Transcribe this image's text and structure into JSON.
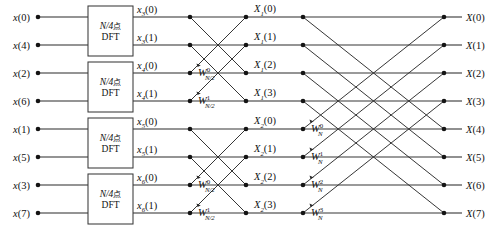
{
  "diagram": {
    "type": "fft-butterfly",
    "colors": {
      "background": "#ffffff",
      "line": "#2b2b2b",
      "node": "#141414",
      "text": "#111111",
      "box_stroke": "#3a3a3a"
    },
    "geometry": {
      "width": 498,
      "height": 236,
      "row_y": [
        17,
        45,
        73,
        101,
        129,
        157,
        185,
        213
      ],
      "col_input_node_x": 38,
      "col_box_left": 88,
      "col_box_right": 133,
      "col_stage2_node_x": 190,
      "col_stage2_out_x": 246,
      "col_stage3_node_x": 303,
      "col_stage3_out_x": 358,
      "col_output_node_x": 444
    }
  },
  "inputs": {
    "label_base": "x",
    "items": [
      {
        "base": "x",
        "arg": "(0)",
        "row": 0
      },
      {
        "base": "x",
        "arg": "(4)",
        "row": 1
      },
      {
        "base": "x",
        "arg": "(2)",
        "row": 2
      },
      {
        "base": "x",
        "arg": "(6)",
        "row": 3
      },
      {
        "base": "x",
        "arg": "(1)",
        "row": 4
      },
      {
        "base": "x",
        "arg": "(5)",
        "row": 5
      },
      {
        "base": "x",
        "arg": "(3)",
        "row": 6
      },
      {
        "base": "x",
        "arg": "(7)",
        "row": 7
      }
    ]
  },
  "dft_blocks": {
    "line1_prefix": "N/4",
    "line1_cjk": "点",
    "line2": "DFT",
    "count": 4,
    "rows": [
      [
        0,
        1
      ],
      [
        2,
        3
      ],
      [
        4,
        5
      ],
      [
        6,
        7
      ]
    ]
  },
  "stage1_outputs": {
    "items": [
      {
        "base": "x",
        "sub": "3",
        "arg": "(0)",
        "row": 0
      },
      {
        "base": "x",
        "sub": "3",
        "arg": "(1)",
        "row": 1
      },
      {
        "base": "x",
        "sub": "4",
        "arg": "(0)",
        "row": 2
      },
      {
        "base": "x",
        "sub": "4",
        "arg": "(1)",
        "row": 3
      },
      {
        "base": "x",
        "sub": "5",
        "arg": "(0)",
        "row": 4
      },
      {
        "base": "x",
        "sub": "5",
        "arg": "(1)",
        "row": 5
      },
      {
        "base": "x",
        "sub": "6",
        "arg": "(0)",
        "row": 6
      },
      {
        "base": "x",
        "sub": "6",
        "arg": "(1)",
        "row": 7
      }
    ]
  },
  "stage2_twiddles": {
    "items": [
      {
        "base": "W",
        "sup": "0",
        "sub": "N/2",
        "row": 2
      },
      {
        "base": "W",
        "sup": "1",
        "sub": "N/2",
        "row": 3
      },
      {
        "base": "W",
        "sup": "0",
        "sub": "N/2",
        "row": 6
      },
      {
        "base": "W",
        "sup": "1",
        "sub": "N/2",
        "row": 7
      }
    ]
  },
  "stage2_outputs": {
    "items": [
      {
        "base": "X",
        "sub": "1",
        "arg": "(0)",
        "row": 0
      },
      {
        "base": "X",
        "sub": "1",
        "arg": "(1)",
        "row": 1
      },
      {
        "base": "X",
        "sub": "1",
        "arg": "(2)",
        "row": 2
      },
      {
        "base": "X",
        "sub": "1",
        "arg": "(3)",
        "row": 3
      },
      {
        "base": "X",
        "sub": "2",
        "arg": "(0)",
        "row": 4
      },
      {
        "base": "X",
        "sub": "2",
        "arg": "(1)",
        "row": 5
      },
      {
        "base": "X",
        "sub": "2",
        "arg": "(2)",
        "row": 6
      },
      {
        "base": "X",
        "sub": "2",
        "arg": "(3)",
        "row": 7
      }
    ]
  },
  "stage3_twiddles": {
    "items": [
      {
        "base": "W",
        "sup": "0",
        "sub": "N",
        "row": 4
      },
      {
        "base": "W",
        "sup": "1",
        "sub": "N",
        "row": 5
      },
      {
        "base": "W",
        "sup": "2",
        "sub": "N",
        "row": 6
      },
      {
        "base": "W",
        "sup": "3",
        "sub": "N",
        "row": 7
      }
    ]
  },
  "outputs": {
    "items": [
      {
        "base": "X",
        "arg": "(0)",
        "row": 0
      },
      {
        "base": "X",
        "arg": "(1)",
        "row": 1
      },
      {
        "base": "X",
        "arg": "(2)",
        "row": 2
      },
      {
        "base": "X",
        "arg": "(3)",
        "row": 3
      },
      {
        "base": "X",
        "arg": "(4)",
        "row": 4
      },
      {
        "base": "X",
        "arg": "(5)",
        "row": 5
      },
      {
        "base": "X",
        "arg": "(6)",
        "row": 6
      },
      {
        "base": "X",
        "arg": "(7)",
        "row": 7
      }
    ]
  }
}
